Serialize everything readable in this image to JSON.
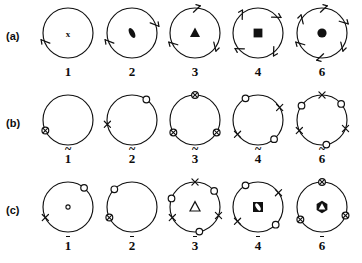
{
  "figure": {
    "background_color": "#ffffff",
    "line_color": "#111111",
    "rows": [
      {
        "id": "a",
        "label": "(a)",
        "kind": "rotation-axes",
        "cells": [
          {
            "caption": "1",
            "accent": "none",
            "order": 1,
            "center_symbol": "x",
            "boundary_markers": [
              {
                "type": "arrow-tick",
                "angle_deg": 205
              }
            ]
          },
          {
            "caption": "2",
            "accent": "none",
            "order": 2,
            "center_symbol": "lens",
            "boundary_markers": [
              {
                "type": "arrow-tick",
                "angle_deg": 205
              },
              {
                "type": "arrow-tick",
                "angle_deg": 25
              }
            ]
          },
          {
            "caption": "3",
            "accent": "none",
            "order": 3,
            "center_symbol": "triangle",
            "boundary_markers": [
              {
                "type": "arrow-tick",
                "angle_deg": 90
              },
              {
                "type": "arrow-tick",
                "angle_deg": 210
              },
              {
                "type": "arrow-tick",
                "angle_deg": 330
              }
            ]
          },
          {
            "caption": "4",
            "accent": "none",
            "order": 4,
            "center_symbol": "square",
            "boundary_markers": [
              {
                "type": "arrow-tick",
                "angle_deg": 45
              },
              {
                "type": "arrow-tick",
                "angle_deg": 135
              },
              {
                "type": "arrow-tick",
                "angle_deg": 225
              },
              {
                "type": "arrow-tick",
                "angle_deg": 315
              }
            ]
          },
          {
            "caption": "6",
            "accent": "none",
            "order": 6,
            "center_symbol": "hexagon",
            "boundary_markers": [
              {
                "type": "arrow-tick",
                "angle_deg": 90
              },
              {
                "type": "arrow-tick",
                "angle_deg": 150
              },
              {
                "type": "arrow-tick",
                "angle_deg": 210
              },
              {
                "type": "arrow-tick",
                "angle_deg": 270
              },
              {
                "type": "arrow-tick",
                "angle_deg": 330
              },
              {
                "type": "arrow-tick",
                "angle_deg": 30
              }
            ]
          }
        ]
      },
      {
        "id": "b",
        "label": "(b)",
        "kind": "rotoreflection-axes",
        "cells": [
          {
            "caption": "1",
            "accent": "tilde",
            "order": 1,
            "center_symbol": "none",
            "boundary_markers": [
              {
                "type": "crossed-circle",
                "angle_deg": 205
              }
            ]
          },
          {
            "caption": "2",
            "accent": "tilde",
            "order": 2,
            "center_symbol": "none",
            "boundary_markers": [
              {
                "type": "open-circle",
                "angle_deg": 55
              },
              {
                "type": "cross",
                "angle_deg": 190
              }
            ]
          },
          {
            "caption": "3",
            "accent": "tilde",
            "order": 3,
            "center_symbol": "none",
            "boundary_markers": [
              {
                "type": "crossed-circle",
                "angle_deg": 90
              },
              {
                "type": "crossed-circle",
                "angle_deg": 210
              },
              {
                "type": "crossed-circle",
                "angle_deg": 330
              }
            ]
          },
          {
            "caption": "4",
            "accent": "tilde",
            "order": 4,
            "center_symbol": "none",
            "boundary_markers": [
              {
                "type": "open-circle",
                "angle_deg": 120
              },
              {
                "type": "cross",
                "angle_deg": 30
              },
              {
                "type": "open-circle",
                "angle_deg": 310
              },
              {
                "type": "cross",
                "angle_deg": 215
              }
            ]
          },
          {
            "caption": "6",
            "accent": "tilde",
            "order": 6,
            "center_symbol": "none",
            "boundary_markers": [
              {
                "type": "cross",
                "angle_deg": 90
              },
              {
                "type": "open-circle",
                "angle_deg": 40
              },
              {
                "type": "cross",
                "angle_deg": 340
              },
              {
                "type": "open-circle",
                "angle_deg": 280
              },
              {
                "type": "cross",
                "angle_deg": 205
              },
              {
                "type": "open-circle",
                "angle_deg": 145
              }
            ]
          }
        ]
      },
      {
        "id": "c",
        "label": "(c)",
        "kind": "rotoinversion-axes",
        "cells": [
          {
            "caption": "1",
            "accent": "bar",
            "order": 1,
            "center_symbol": "small-open-circle",
            "boundary_markers": [
              {
                "type": "open-circle",
                "angle_deg": 50
              },
              {
                "type": "cross",
                "angle_deg": 205
              }
            ]
          },
          {
            "caption": "2",
            "accent": "bar",
            "order": 2,
            "center_symbol": "none",
            "boundary_markers": [
              {
                "type": "crossed-circle",
                "angle_deg": 205
              },
              {
                "type": "open-circle",
                "angle_deg": 135
              }
            ]
          },
          {
            "caption": "3",
            "accent": "bar",
            "order": 3,
            "center_symbol": "open-triangle",
            "boundary_markers": [
              {
                "type": "cross",
                "angle_deg": 90
              },
              {
                "type": "open-circle",
                "angle_deg": 40
              },
              {
                "type": "cross",
                "angle_deg": 340
              },
              {
                "type": "open-circle",
                "angle_deg": 280
              },
              {
                "type": "cross",
                "angle_deg": 205
              },
              {
                "type": "open-circle",
                "angle_deg": 160
              }
            ]
          },
          {
            "caption": "4",
            "accent": "bar",
            "order": 4,
            "center_symbol": "square-lens",
            "boundary_markers": [
              {
                "type": "open-circle",
                "angle_deg": 120
              },
              {
                "type": "cross",
                "angle_deg": 35
              },
              {
                "type": "open-circle",
                "angle_deg": 315
              },
              {
                "type": "cross",
                "angle_deg": 215
              }
            ]
          },
          {
            "caption": "6",
            "accent": "bar",
            "order": 6,
            "center_symbol": "hexagon-triangle",
            "boundary_markers": [
              {
                "type": "crossed-circle",
                "angle_deg": 90
              },
              {
                "type": "crossed-circle",
                "angle_deg": 340
              },
              {
                "type": "crossed-circle",
                "angle_deg": 210
              }
            ]
          }
        ]
      }
    ]
  }
}
